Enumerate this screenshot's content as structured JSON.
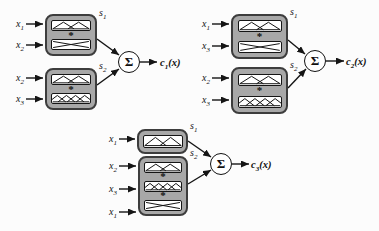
{
  "figure": {
    "colors": {
      "background": "#fcfcfc",
      "box_fill": "#a8a8a8",
      "box_border": "#3d3d3d",
      "strip_fill": "#ffffff",
      "line": "#151515"
    },
    "operator": "*",
    "sum_symbol": "Σ",
    "diagrams": [
      {
        "output": {
          "base": "c",
          "sub": "1",
          "arg": "(x)"
        },
        "blocks": [
          {
            "label": {
              "base": "s",
              "sub": "1"
            },
            "inputs": [
              {
                "base": "x",
                "sub": "1"
              },
              {
                "base": "x",
                "sub": "2"
              }
            ],
            "strips": [
              "two-triangles",
              "crossing-ramps"
            ]
          },
          {
            "label": {
              "base": "s",
              "sub": "2"
            },
            "inputs": [
              {
                "base": "x",
                "sub": "2"
              },
              {
                "base": "x",
                "sub": "3"
              }
            ],
            "strips": [
              "two-triangles",
              "four-triangles"
            ]
          }
        ]
      },
      {
        "output": {
          "base": "c",
          "sub": "2",
          "arg": "(x)"
        },
        "blocks": [
          {
            "label": {
              "base": "s",
              "sub": "1"
            },
            "inputs": [
              {
                "base": "x",
                "sub": "1"
              },
              {
                "base": "x",
                "sub": "3"
              }
            ],
            "strips": [
              "two-triangles",
              "crossing-ramps"
            ]
          },
          {
            "label": {
              "base": "s",
              "sub": "2"
            },
            "inputs": [
              {
                "base": "x",
                "sub": "2"
              },
              {
                "base": "x",
                "sub": "3"
              }
            ],
            "strips": [
              "two-triangles",
              "four-triangles"
            ]
          }
        ]
      },
      {
        "output": {
          "base": "c",
          "sub": "3",
          "arg": "(x)"
        },
        "blocks": [
          {
            "label": {
              "base": "s",
              "sub": "1"
            },
            "inputs": [
              {
                "base": "x",
                "sub": "1"
              }
            ],
            "strips": [
              "two-triangles"
            ]
          },
          {
            "label": {
              "base": "s",
              "sub": "2"
            },
            "inputs": [
              {
                "base": "x",
                "sub": "2"
              },
              {
                "base": "x",
                "sub": "3"
              },
              {
                "base": "x",
                "sub": "1"
              }
            ],
            "strips": [
              "two-triangles",
              "four-triangles",
              "crossing-ramps"
            ]
          }
        ]
      }
    ]
  }
}
